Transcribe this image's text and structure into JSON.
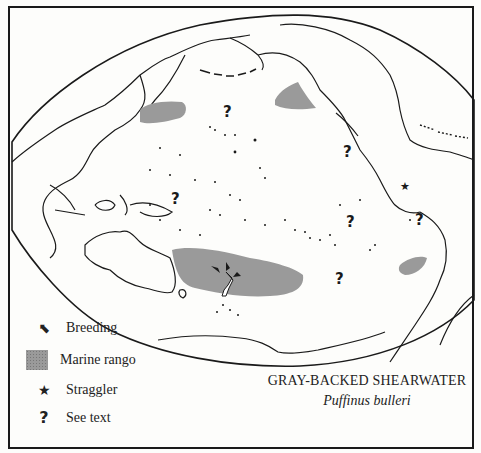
{
  "map": {
    "title": "GRAY-BACKED SHEARWATER",
    "subtitle": "Puffinus bulleri",
    "colors": {
      "ink": "#1a1a1a",
      "marine_range": "#9a9a9a",
      "paper": "#fdfdfb"
    },
    "marine_ranges": [
      {
        "name": "northwest-pacific-range",
        "region": "off Japan"
      },
      {
        "name": "gulf-of-alaska-range",
        "region": "off British Columbia"
      },
      {
        "name": "southwest-pacific-range",
        "region": "around New Zealand"
      },
      {
        "name": "off-chile-range",
        "region": "off Chile"
      }
    ],
    "breeding_site": "New Zealand",
    "straggler_marker": "eastern Pacific",
    "see_text_marker_count": 7
  },
  "legend": {
    "items": [
      {
        "symbol": "breeding-arrow-icon",
        "glyph": "⬉",
        "label": "Breeding"
      },
      {
        "symbol": "marine-range-swatch",
        "glyph": "",
        "label": "Marine rango"
      },
      {
        "symbol": "star-icon",
        "glyph": "★",
        "label": "Straggler"
      },
      {
        "symbol": "question-mark-icon",
        "glyph": "?",
        "label": "See text"
      }
    ]
  },
  "markers": {
    "question": "?",
    "star": "★"
  }
}
